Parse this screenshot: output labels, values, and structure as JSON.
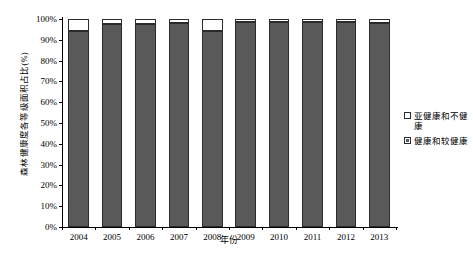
{
  "chart_data": {
    "type": "bar",
    "subtype": "stacked-bar-100-percent",
    "title": "",
    "xlabel": "年份",
    "ylabel": "森林健康度各等级面积占比(%)",
    "categories": [
      "2004",
      "2005",
      "2006",
      "2007",
      "2008",
      "2009",
      "2010",
      "2011",
      "2012",
      "2013"
    ],
    "ylim": [
      0,
      100
    ],
    "ytick_labels": [
      "0%",
      "10%",
      "20%",
      "30%",
      "40%",
      "50%",
      "60%",
      "70%",
      "80%",
      "90%",
      "100%"
    ],
    "ytick_values": [
      0,
      10,
      20,
      30,
      40,
      50,
      60,
      70,
      80,
      90,
      100
    ],
    "grid": false,
    "legend_position": "right",
    "series": [
      {
        "name": "健康和较健康",
        "color": "#595959",
        "values": [
          94.2,
          97.6,
          97.6,
          98.2,
          94.2,
          98.4,
          98.4,
          98.4,
          98.4,
          98.2
        ]
      },
      {
        "name": "亚健康和不健康",
        "color": "#ffffff",
        "values": [
          5.8,
          2.4,
          2.4,
          1.8,
          5.8,
          1.6,
          1.6,
          1.6,
          1.6,
          1.8
        ]
      }
    ]
  },
  "axes": {
    "y_title": "森林健康度各等级面积占比(%)",
    "x_title": "年份"
  },
  "legend": {
    "entries": [
      {
        "label": "亚健康和不健康",
        "swatch": "white-square-icon"
      },
      {
        "label": "健康和较健康",
        "swatch": "dark-square-icon"
      }
    ]
  },
  "caption": ""
}
